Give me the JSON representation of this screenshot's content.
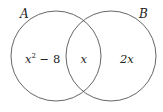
{
  "diagram": {
    "type": "venn",
    "sets": [
      {
        "name": "A",
        "label": "A"
      },
      {
        "name": "B",
        "label": "B"
      }
    ],
    "regions": {
      "a_only": {
        "base": "x",
        "sup": "2",
        "rest": " − 8"
      },
      "intersection": "x",
      "b_only": "2x"
    },
    "colors": {
      "stroke": "#555555",
      "text": "#222222",
      "background": "#ffffff"
    }
  }
}
